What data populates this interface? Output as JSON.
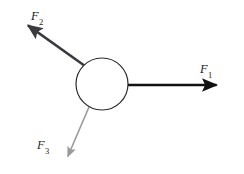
{
  "figure": {
    "background_color": "#ffffff",
    "width": 244,
    "height": 174
  },
  "body_node": {
    "name": "central-body",
    "shape": "circle",
    "center_x": 102,
    "center_y": 84,
    "radius": 26,
    "stroke_color": "#2b2b2b",
    "fill_color": "#ffffff",
    "stroke_width": 1.2
  },
  "forces": [
    {
      "id": "f1",
      "label_symbol": "F",
      "label_subscript": "1",
      "label_text": "F1",
      "direction": "right",
      "color": "#111111",
      "stroke_width": 2.6,
      "start_x": 128,
      "start_y": 85,
      "end_x": 228,
      "end_y": 85,
      "label_x": 200,
      "label_y": 63
    },
    {
      "id": "f2",
      "label_symbol": "F",
      "label_subscript": "2",
      "label_text": "F2",
      "direction": "up-left",
      "color": "#3a3a3f",
      "stroke_width": 2.5,
      "start_x": 85,
      "start_y": 66,
      "end_x": 19,
      "end_y": 19,
      "label_x": 31,
      "label_y": 10
    },
    {
      "id": "f3",
      "label_symbol": "F",
      "label_subscript": "3",
      "label_text": "F3",
      "direction": "down-left",
      "color": "#9a9a9a",
      "stroke_width": 1.6,
      "start_x": 89,
      "start_y": 107,
      "end_x": 65,
      "end_y": 163,
      "label_x": 37,
      "label_y": 139
    }
  ]
}
